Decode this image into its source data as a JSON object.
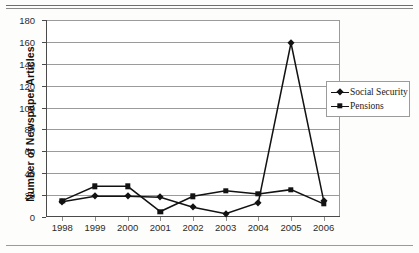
{
  "page": {
    "rules": {
      "top_double": true,
      "bottom_single": true
    }
  },
  "chart_data": {
    "type": "line",
    "title": "",
    "xlabel": "",
    "ylabel": "Number of Newspaper Articles",
    "categories": [
      "1998",
      "1999",
      "2000",
      "2001",
      "2002",
      "2003",
      "2004",
      "2005",
      "2006"
    ],
    "x": [
      1998,
      1999,
      2000,
      2001,
      2002,
      2003,
      2004,
      2005,
      2006
    ],
    "ylim": [
      0,
      180
    ],
    "ytick_step": 20,
    "yticks": [
      "0",
      "20",
      "40",
      "60",
      "80",
      "100",
      "120",
      "140",
      "160",
      "180"
    ],
    "ytick_values": [
      0,
      20,
      40,
      60,
      80,
      100,
      120,
      140,
      160,
      180
    ],
    "grid": "horizontal",
    "legend_position": "right",
    "series": [
      {
        "name": "Social Security",
        "marker": "diamond",
        "color": "#121212",
        "values": [
          14,
          19,
          19,
          18,
          9,
          3,
          13,
          159,
          15
        ]
      },
      {
        "name": "Pensions",
        "marker": "square",
        "color": "#121212",
        "values": [
          15,
          28,
          28,
          5,
          19,
          24,
          21,
          25,
          12
        ]
      }
    ]
  },
  "legend": {
    "items": [
      {
        "label": "Social Security",
        "marker": "diamond"
      },
      {
        "label": "Pensions",
        "marker": "square"
      }
    ]
  },
  "colors": {
    "series": "#121212",
    "grid": "#9b9b9b",
    "axis": "#4a4a4a",
    "text": "#1a1a1a",
    "background": "#ffffff"
  }
}
